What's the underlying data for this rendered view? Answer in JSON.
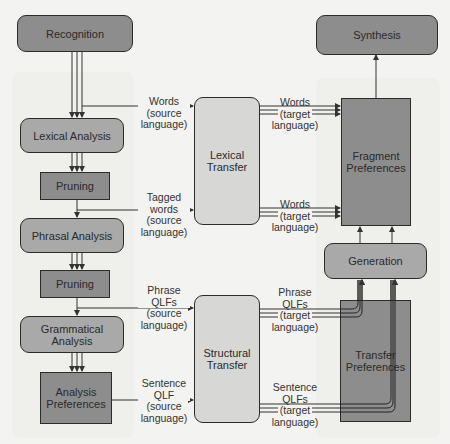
{
  "diagram": {
    "analysis_column": {
      "recognition": "Recognition",
      "lexical_analysis": "Lexical Analysis",
      "pruning_1": "Pruning",
      "phrasal_analysis": "Phrasal Analysis",
      "pruning_2": "Pruning",
      "grammatical_analysis": "Grammatical Analysis",
      "analysis_preferences": "Analysis Preferences"
    },
    "transfer_column": {
      "lexical_transfer": "Lexical Transfer",
      "structural_transfer": "Structural Transfer"
    },
    "synthesis_column": {
      "synthesis": "Synthesis",
      "fragment_preferences": "Fragment Preferences",
      "generation": "Generation",
      "transfer_preferences": "Transfer Preferences"
    },
    "edge_labels": {
      "words_source": [
        "Words",
        "(source",
        "language)"
      ],
      "tagged_words_source": [
        "Tagged",
        "words",
        "(source",
        "language)"
      ],
      "phrase_qlfs_source": [
        "Phrase",
        "QLFs",
        "(source",
        "language)"
      ],
      "sentence_qlf_source": [
        "Sentence",
        "QLF",
        "(source",
        "language)"
      ],
      "words_target_1": [
        "Words",
        "(target",
        "language)"
      ],
      "words_target_2": [
        "Words",
        "(target",
        "language)"
      ],
      "phrase_qlfs_target": [
        "Phrase",
        "QLFs",
        "(target",
        "language)"
      ],
      "sentence_qlfs_target": [
        "Sentence",
        "QLFs",
        "(target",
        "language)"
      ]
    }
  }
}
